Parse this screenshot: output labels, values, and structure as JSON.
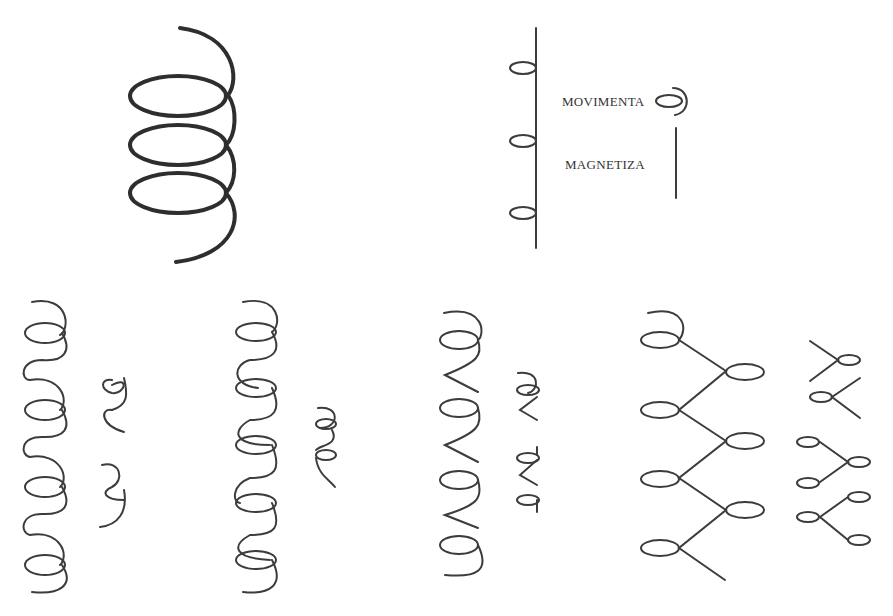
{
  "legend": {
    "items": [
      {
        "label": "MOVIMENTA",
        "symbol": "spiral-loop"
      },
      {
        "label": "MAGNETIZA",
        "symbol": "straight-line"
      }
    ]
  },
  "figures": [
    {
      "name": "large-helix",
      "loops": 3
    },
    {
      "name": "vertical-line-with-loops",
      "loops": 3
    },
    {
      "name": "column-1-spiral",
      "loops": 4
    },
    {
      "name": "column-2-spiral",
      "loops": 5
    },
    {
      "name": "column-3-zigzag-spiral",
      "loops": 4
    },
    {
      "name": "column-4-branching-spiral",
      "loops": 7
    }
  ],
  "colors": {
    "ink": "#333333",
    "background": "#ffffff"
  }
}
